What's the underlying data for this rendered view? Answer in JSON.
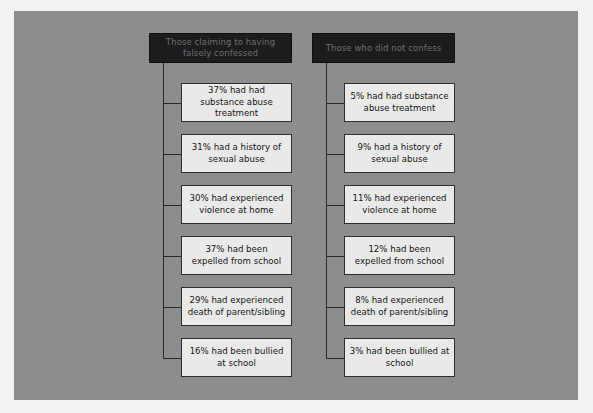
{
  "figure": {
    "background_color": "#f2f2f2",
    "plate_color": "#8d8d8d",
    "header_fill": "#1c1c1c",
    "header_text_color": "#6e6e6e",
    "box_fill": "#e9e9e9",
    "box_border": "#2e2e2e",
    "connector_color": "#2a2a2a"
  },
  "columns": [
    {
      "header": "Those claiming to having falsely confessed",
      "items": [
        "37% had had substance abuse treatment",
        "31% had a history of sexual abuse",
        "30% had experienced violence at home",
        "37% had been expelled from school",
        "29% had experienced death of parent/sibling",
        "16% had been bullied at school"
      ]
    },
    {
      "header": "Those who did not confess",
      "items": [
        "5% had had substance abuse treatment",
        "9% had a history of sexual abuse",
        "11% had experienced violence at home",
        "12% had been expelled from school",
        "8% had experienced death of parent/sibling",
        "3% had been bullied at school"
      ]
    }
  ]
}
